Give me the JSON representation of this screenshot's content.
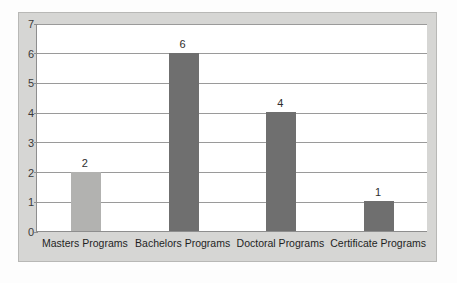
{
  "figure": {
    "frame_background": "#d6d6d4",
    "plot_background": "#ffffff",
    "axis_color": "#8e8e8e",
    "grid_color": "#9a9a9a"
  },
  "chart_data": {
    "type": "bar",
    "title": "",
    "xlabel": "",
    "ylabel": "",
    "categories": [
      "Masters Programs",
      "Bachelors Programs",
      "Doctoral Programs",
      "Certificate Programs"
    ],
    "values": [
      2,
      6,
      4,
      1
    ],
    "data_labels": [
      "2",
      "6",
      "4",
      "1"
    ],
    "bar_colors": [
      "#b2b2b0",
      "#6f6f6f",
      "#6f6f6f",
      "#6f6f6f"
    ],
    "ylim": [
      0,
      7
    ],
    "yticks": [
      0,
      1,
      2,
      3,
      4,
      5,
      6,
      7
    ],
    "ytick_labels": [
      "0",
      "1",
      "2",
      "3",
      "4",
      "5",
      "6",
      "7"
    ],
    "grid": true,
    "grid_axis": "y",
    "legend": false,
    "legend_position": "none"
  }
}
